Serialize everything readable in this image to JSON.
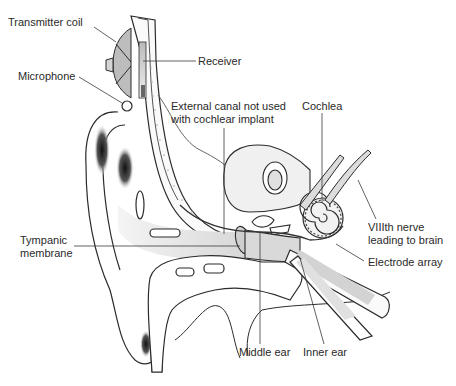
{
  "diagram": {
    "colors": {
      "line": "#2b2b2b",
      "leader": "#3a3a3a",
      "fill_light": "#e6e6e6",
      "fill_mid": "#cfcfcf",
      "shadow_dark": "#1a1a1a",
      "text": "#2a2a2a"
    },
    "labels": {
      "transmitter_coil": "Transmitter coil",
      "receiver": "Receiver",
      "microphone": "Microphone",
      "external_canal_line1": "External canal not used",
      "external_canal_line2": "with cochlear implant",
      "cochlea": "Cochlea",
      "tympanic_line1": "Tympanic",
      "tympanic_line2": "membrane",
      "viiith_line1": "VIIIth nerve",
      "viiith_line2": "leading to brain",
      "electrode_array": "Electrode array",
      "middle_ear": "Middle ear",
      "inner_ear": "Inner ear"
    }
  }
}
